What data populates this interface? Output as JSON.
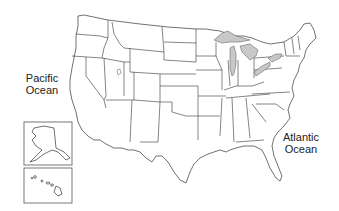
{
  "map": {
    "title": "",
    "type": "outline map of the United States with state borders",
    "labels": {
      "pacific": "Pacific\nOcean",
      "pacific_line1": "Pacific",
      "pacific_line2": "Ocean",
      "atlantic_line1": "Atlantic",
      "atlantic_line2": "Ocean"
    },
    "insets": [
      {
        "name": "Alaska",
        "box": [
          24,
          122,
          48,
          43
        ]
      },
      {
        "name": "Hawaii",
        "box": [
          24,
          168,
          48,
          35
        ]
      }
    ],
    "features": {
      "great_lakes_fill": "#c8c8c8",
      "state_fill": "#ffffff",
      "border_color": "#333333"
    }
  }
}
